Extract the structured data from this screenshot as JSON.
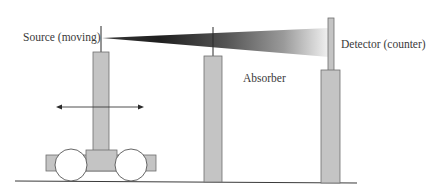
{
  "diagram": {
    "type": "experimental-setup",
    "labels": {
      "source": "Source (moving)",
      "absorber": "Absorber",
      "detector": "Detector (counter)"
    },
    "colors": {
      "pillar_fill": "#c4c4c4",
      "pillar_stroke": "#6e6e6e",
      "line": "#3a3a3a",
      "beam_dark": "#1e1e1e",
      "beam_light": "#f2f2f2",
      "background": "#ffffff"
    },
    "components": [
      {
        "id": "source",
        "description": "Moving source on a wheeled cart with bidirectional motion arrow"
      },
      {
        "id": "beam",
        "description": "Radiation beam widening from source to detector, dark near source fading lighter toward detector"
      },
      {
        "id": "absorber",
        "description": "Absorber on a pillar in the beam path"
      },
      {
        "id": "detector",
        "description": "Detector (counter) on a pillar at the far end of the beam"
      }
    ]
  }
}
